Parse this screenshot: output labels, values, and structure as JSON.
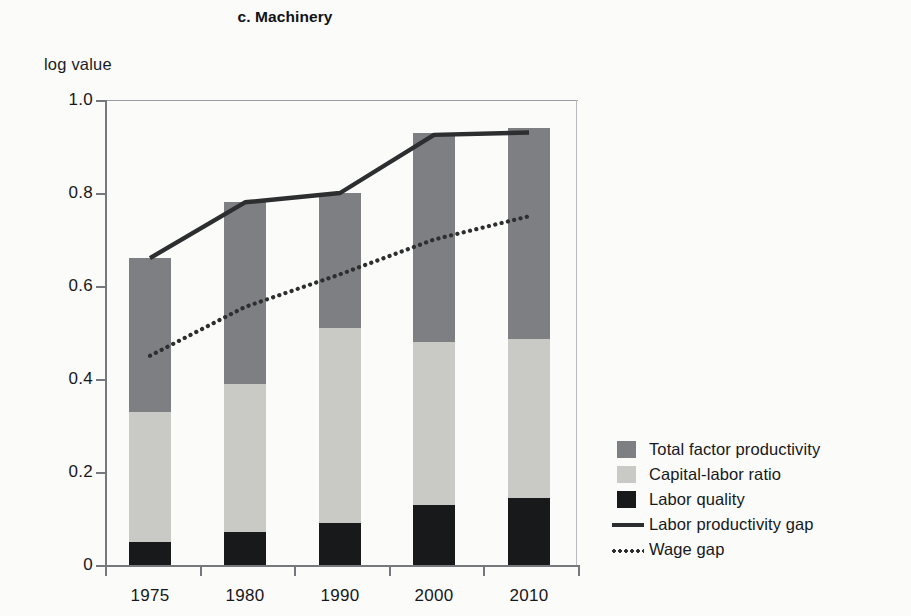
{
  "chart_data": {
    "type": "bar",
    "subtype": "stacked-bar-with-lines",
    "title": "c. Machinery",
    "xlabel": "",
    "ylabel": "log value",
    "categories": [
      "1975",
      "1980",
      "1990",
      "2000",
      "2010"
    ],
    "ylim": [
      0,
      1.0
    ],
    "yticks": [
      0,
      0.2,
      0.4,
      0.6,
      0.8,
      1.0
    ],
    "ytick_labels": [
      "0",
      "0.2",
      "0.4",
      "0.6",
      "0.8",
      "1.0"
    ],
    "grid": false,
    "legend_position": "right",
    "series": [
      {
        "name": "Total factor productivity",
        "kind": "bar-segment",
        "color": "#7d7f82",
        "cumulative_top": [
          0.66,
          0.78,
          0.8,
          0.93,
          0.94
        ],
        "values": [
          0.33,
          0.39,
          0.29,
          0.45,
          0.455
        ]
      },
      {
        "name": "Capital-labor ratio",
        "kind": "bar-segment",
        "color": "#c9cac6",
        "cumulative_top": [
          0.33,
          0.39,
          0.51,
          0.48,
          0.485
        ],
        "values": [
          0.28,
          0.32,
          0.42,
          0.35,
          0.34
        ]
      },
      {
        "name": "Labor quality",
        "kind": "bar-segment",
        "color": "#18191b",
        "cumulative_top": [
          0.05,
          0.07,
          0.09,
          0.13,
          0.145
        ],
        "values": [
          0.05,
          0.07,
          0.09,
          0.13,
          0.145
        ]
      },
      {
        "name": "Labor productivity gap",
        "kind": "line",
        "style": "solid",
        "color": "#2c2e30",
        "values": [
          0.66,
          0.78,
          0.8,
          0.925,
          0.93
        ]
      },
      {
        "name": "Wage gap",
        "kind": "line",
        "style": "dotted",
        "color": "#2c2e30",
        "values": [
          0.45,
          0.555,
          0.625,
          0.7,
          0.75
        ]
      }
    ]
  },
  "legend": {
    "items": [
      {
        "label": "Total factor productivity",
        "key": "swatch",
        "color": "#7d7f82"
      },
      {
        "label": "Capital-labor ratio",
        "key": "swatch",
        "color": "#c9cac6"
      },
      {
        "label": "Labor quality",
        "key": "swatch",
        "color": "#18191b"
      },
      {
        "label": "Labor productivity gap",
        "key": "solid-line",
        "color": "#2c2e30"
      },
      {
        "label": "Wage gap",
        "key": "dotted-line",
        "color": "#2c2e30"
      }
    ]
  }
}
